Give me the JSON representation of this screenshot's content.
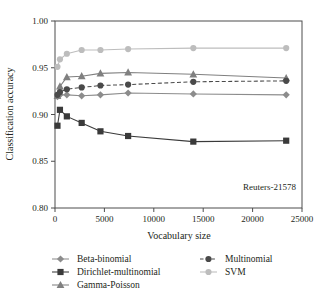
{
  "chart_data": {
    "type": "line",
    "title": "",
    "xlabel": "Vocabulary size",
    "ylabel": "Classification accuracy",
    "annotation": "Reuters-21578",
    "xlim": [
      0,
      25000
    ],
    "ylim": [
      0.8,
      1.0
    ],
    "grid": false,
    "legend_position": "bottom",
    "xticks": [
      0,
      5000,
      10000,
      15000,
      20000,
      25000
    ],
    "xtick_labels": [
      "0",
      "5000",
      "10000",
      "15000",
      "20000",
      "25000"
    ],
    "yticks": [
      0.8,
      0.85,
      0.9,
      0.95,
      1.0
    ],
    "ytick_labels": [
      "0.80",
      "0.85",
      "0.90",
      "0.95",
      "1.00"
    ],
    "x": [
      250,
      500,
      1200,
      2700,
      4600,
      7400,
      14000,
      23400
    ],
    "series": [
      {
        "name": "Beta-binomial",
        "marker": "diamond",
        "line_style": "solid",
        "color": "#8c8c8c",
        "values": [
          0.919,
          0.921,
          0.921,
          0.92,
          0.921,
          0.923,
          0.922,
          0.921
        ]
      },
      {
        "name": "Dirichlet-multinomial",
        "marker": "square",
        "line_style": "solid",
        "color": "#3a3a3a",
        "values": [
          0.888,
          0.905,
          0.898,
          0.891,
          0.882,
          0.877,
          0.871,
          0.872
        ]
      },
      {
        "name": "Gamma-Poisson",
        "marker": "triangle",
        "line_style": "solid",
        "color": "#808080",
        "values": [
          0.92,
          0.93,
          0.94,
          0.941,
          0.944,
          0.945,
          0.943,
          0.939
        ]
      },
      {
        "name": "Multinomial",
        "marker": "circle",
        "line_style": "dashed",
        "color": "#4a4a4a",
        "values": [
          0.921,
          0.924,
          0.927,
          0.929,
          0.931,
          0.932,
          0.935,
          0.936
        ]
      },
      {
        "name": "SVM",
        "marker": "circle",
        "line_style": "solid",
        "color": "#bdbdbd",
        "values": [
          0.951,
          0.959,
          0.965,
          0.969,
          0.969,
          0.97,
          0.971,
          0.971
        ]
      }
    ]
  },
  "legend": {
    "entries": [
      {
        "label": "Beta-binomial"
      },
      {
        "label": "Dirichlet-multinomial"
      },
      {
        "label": "Gamma-Poisson"
      },
      {
        "label": "Multinomial"
      },
      {
        "label": "SVM"
      }
    ]
  }
}
